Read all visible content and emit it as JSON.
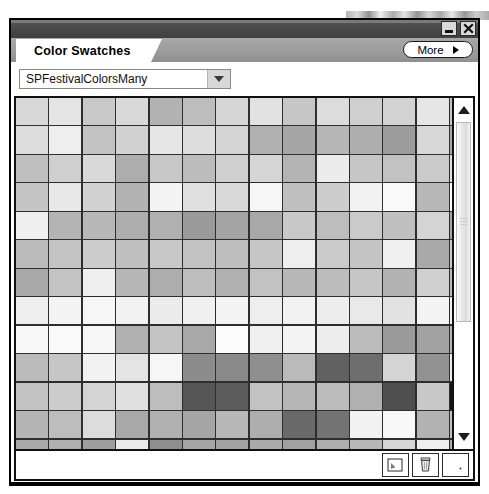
{
  "window": {
    "caption_buttons": [
      {
        "name": "minimize-button",
        "glyph": "minimize"
      },
      {
        "name": "close-button",
        "glyph": "close"
      }
    ]
  },
  "panel": {
    "tab_label": "Color Swatches",
    "grip_icon": "grip-dots-icon",
    "more_button": {
      "label": "More",
      "arrow_icon": "triangle-right-icon"
    }
  },
  "swatch_library": {
    "selected": "SPFestivalColorsMany",
    "placeholder": "SPFestivalColorsMany",
    "dropdown_icon": "chevron-down-icon"
  },
  "scrollbar": {
    "up_icon": "chevron-up-icon",
    "down_icon": "chevron-down-icon",
    "thumb_position_percent": 0,
    "thumb_size_percent": 66
  },
  "toolbar": {
    "buttons": [
      {
        "name": "new-swatch-button",
        "icon": "new-swatch-icon"
      },
      {
        "name": "delete-swatch-button",
        "icon": "trash-icon"
      },
      {
        "name": "swatch-options-button",
        "icon": "blank-page-icon"
      }
    ]
  },
  "grid": {
    "columns": 14,
    "rows": 13,
    "cell_width": 32,
    "cell_height": 27,
    "gridline_color": "#2e2e2e",
    "colors": [
      [
        "#d8d8d8",
        "#e4e4e4",
        "#c9c9c9",
        "#d9d9d9",
        "#b2b2b2",
        "#bdbdbd",
        "#d6d6d6",
        "#e2e2e2",
        "#c6c6c6",
        "#dcdcdc",
        "#cfcfcf",
        "#d3d3d3",
        "#e6e6e6",
        "#c4c4c4"
      ],
      [
        "#dcdcdc",
        "#eeeeee",
        "#c3c3c3",
        "#d2d2d2",
        "#e6e6e6",
        "#dddddd",
        "#d4d4d4",
        "#b0b0b0",
        "#a6a6a6",
        "#b6b6b6",
        "#aeaeae",
        "#9c9c9c",
        "#d8d8d8",
        "#a8a8a8"
      ],
      [
        "#bfbfbf",
        "#cfcfcf",
        "#d9d9d9",
        "#adadad",
        "#c8c8c8",
        "#bcbcbc",
        "#cfcfcf",
        "#d6d6d6",
        "#b4b4b4",
        "#ececec",
        "#c6c6c6",
        "#c2c2c2",
        "#cacaca",
        "#dfdfdf"
      ],
      [
        "#c5c5c5",
        "#e8e8e8",
        "#d2d2d2",
        "#b3b3b3",
        "#f4f4f4",
        "#e0e0e0",
        "#dadada",
        "#f6f6f6",
        "#c0c0c0",
        "#cdcdcd",
        "#f2f2f2",
        "#fafafa",
        "#b8b8b8",
        "#fbfbfb"
      ],
      [
        "#efefef",
        "#b4b4b4",
        "#b8b8b8",
        "#adadad",
        "#b0b0b0",
        "#9a9a9a",
        "#a4a4a4",
        "#a8a8a8",
        "#c8c8c8",
        "#bdbdbd",
        "#cacaca",
        "#c0c0c0",
        "#d4d4d4",
        "#a3a3a3"
      ],
      [
        "#bbbbbb",
        "#c4c4c4",
        "#cccccc",
        "#c0c0c0",
        "#c8c8c8",
        "#c2c2c2",
        "#bebebe",
        "#c6c6c6",
        "#eeeeee",
        "#cacaca",
        "#c4c4c4",
        "#f0f0f0",
        "#a9a9a9",
        "#c9c9c9"
      ],
      [
        "#a8a8a8",
        "#c4c4c4",
        "#efefef",
        "#b6b6b6",
        "#adadad",
        "#bebebe",
        "#b0b0b0",
        "#c2c2c2",
        "#b8b8b8",
        "#bcbcbc",
        "#c6c6c6",
        "#b2b2b2",
        "#d0d0d0",
        "#bababa"
      ],
      [
        "#eeeeee",
        "#f4f4f4",
        "#f6f6f6",
        "#f2f2f2",
        "#ececec",
        "#f0f0f0",
        "#f4f4f4",
        "#eeeeee",
        "#f2f2f2",
        "#ededed",
        "#e9e9e9",
        "#e2e2e2",
        "#f4f4f4",
        "#efefef"
      ],
      [
        "#f8f8f8",
        "#fafafa",
        "#f6f6f6",
        "#b0b0b0",
        "#c4c4c4",
        "#a8a8a8",
        "#fbfbfb",
        "#f0f0f0",
        "#f4f4f4",
        "#ededed",
        "#bcbcbc",
        "#9a9a9a",
        "#a2a2a2",
        "#b4b4b4"
      ],
      [
        "#bababa",
        "#c6c6c6",
        "#f2f2f2",
        "#e4e4e4",
        "#f6f6f6",
        "#8c8c8c",
        "#8a8a8a",
        "#8f8f8f",
        "#bababa",
        "#616161",
        "#6e6e6e",
        "#d4d4d4",
        "#929292",
        "#ededed"
      ],
      [
        "#c2c2c2",
        "#cccccc",
        "#d4d4d4",
        "#e0e0e0",
        "#bdbdbd",
        "#565656",
        "#5c5c5c",
        "#c2c2c2",
        "#b6b6b6",
        "#bcbcbc",
        "#b0b0b0",
        "#4f4f4f",
        "#c8c8c8",
        "#161616"
      ],
      [
        "#b4b4b4",
        "#bdbdbd",
        "#dcdcdc",
        "#a8a8a8",
        "#b0b0b0",
        "#a5a5a5",
        "#b8b8b8",
        "#aeaeae",
        "#6a6a6a",
        "#737373",
        "#f2f2f2",
        "#f8f8f8",
        "#b2b2b2",
        "#c0c0c0"
      ],
      [
        "#a8a8a8",
        "#b0b0b0",
        "#9e9e9e",
        "#eaeaea",
        "#8f8f8f",
        "#a6a6a6",
        "#a2a2a2",
        "#aaaaaa",
        "#a0a0a0",
        "#adadad",
        "#b8b8b8",
        "#d6d6d6",
        "#eeeeee",
        "#aaaaaa"
      ]
    ]
  }
}
